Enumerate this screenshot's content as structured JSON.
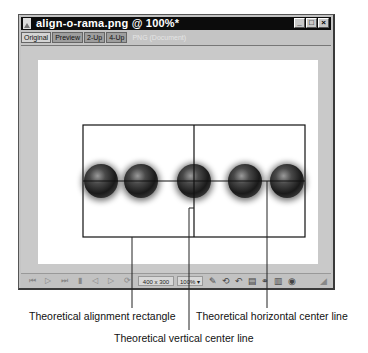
{
  "window": {
    "title": "align-o-rama.png @ 100%*",
    "icon": "document-image-icon",
    "controls": [
      {
        "name": "minimize",
        "glyph": "_"
      },
      {
        "name": "maximize",
        "glyph": "□"
      },
      {
        "name": "close",
        "glyph": "×"
      }
    ]
  },
  "tabs": [
    {
      "label": "Original",
      "active": true
    },
    {
      "label": "Preview",
      "active": false
    },
    {
      "label": "2-Up",
      "active": false
    },
    {
      "label": "4-Up",
      "active": false
    }
  ],
  "tab_disabled_label": "PNG (Document)",
  "status_bar": {
    "playback": [
      "first-frame",
      "play",
      "last-frame",
      "stop",
      "prev-frame",
      "next-frame",
      "loop"
    ],
    "dimensions": "400 x 300",
    "zoom": "100%",
    "zoom_arrow": "▾",
    "tools": [
      "pen-icon",
      "refresh-icon",
      "undo-icon",
      "layers-icon",
      "link-icon",
      "library-icon",
      "info-icon"
    ]
  },
  "image": {
    "sphere_count": 5,
    "sphere_color": "#2a2a2a"
  },
  "callouts": {
    "rectangle": "Theoretical alignment rectangle",
    "vertical": "Theoretical vertical center line",
    "horizontal": "Theoretical horizontal center line"
  }
}
